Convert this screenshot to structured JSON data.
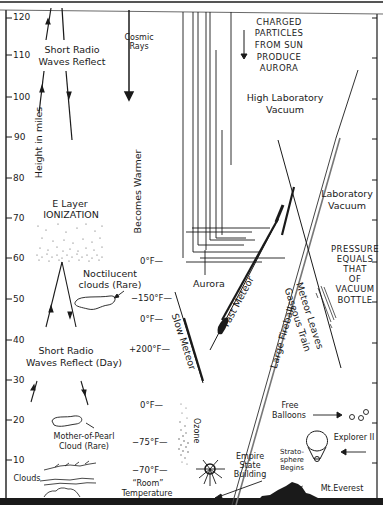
{
  "diagram": {
    "y_axis": {
      "label": "Height in miles",
      "ticks": [
        "120",
        "110",
        "100",
        "90",
        "80",
        "70",
        "60",
        "50",
        "40",
        "30",
        "20",
        "10"
      ]
    },
    "labels": {
      "short_radio_high": [
        "Short Radio",
        "Waves Reflect"
      ],
      "cosmic_rays": [
        "Cosmic",
        "Rays"
      ],
      "charged_particles": [
        "CHARGED",
        "PARTICLES",
        "FROM SUN",
        "PRODUCE",
        "AURORA"
      ],
      "high_lab_vacuum": [
        "High Laboratory",
        "Vacuum"
      ],
      "becomes_warmer": "Becomes Warmer",
      "e_layer": [
        "E Layer",
        "IONIZATION"
      ],
      "noctilucent": [
        "Noctilucent",
        "clouds (Rare)"
      ],
      "lab_vacuum": [
        "Laboratory",
        "Vacuum"
      ],
      "aurora": "Aurora",
      "pressure_bottle": [
        "PRESSURE",
        "EQUALS",
        "THAT",
        "OF",
        "VACUUM",
        "BOTTLE"
      ],
      "fast_meteor": "Fast Meteor",
      "slow_meteor": "Slow Meteor",
      "large_fireball": "Large Fireball",
      "meteor_leaves": [
        "Meteor Leaves",
        "Gaseous Train"
      ],
      "short_radio_day": [
        "Short Radio",
        "Waves Reflect (Day)"
      ],
      "mother_of_pearl": [
        "Mother-of-Pearl",
        "Cloud (Rare)"
      ],
      "ozone": "Ozone",
      "free_balloons": [
        "Free",
        "Balloons"
      ],
      "explorer": "Explorer II",
      "stratosphere": [
        "Strato-",
        "sphere",
        "Begins"
      ],
      "empire_state": [
        "Empire",
        "State",
        "Building"
      ],
      "clouds": "Clouds",
      "room_temp": [
        "“Room”",
        "Temperature"
      ],
      "mt_everest": "Mt.Everest"
    },
    "temperatures": {
      "t_0_upper": "0°F—",
      "t_minus150": "−150°F—",
      "t_0_mid": "0°F—",
      "t_plus200": "+200°F—",
      "t_0_lower": "0°F—",
      "t_minus75": "−75°F—",
      "t_minus70": "−70°F—"
    },
    "colors": {
      "ink": "#1a1a1a",
      "paper": "#ffffff",
      "gray": "#6e6e6e"
    }
  }
}
